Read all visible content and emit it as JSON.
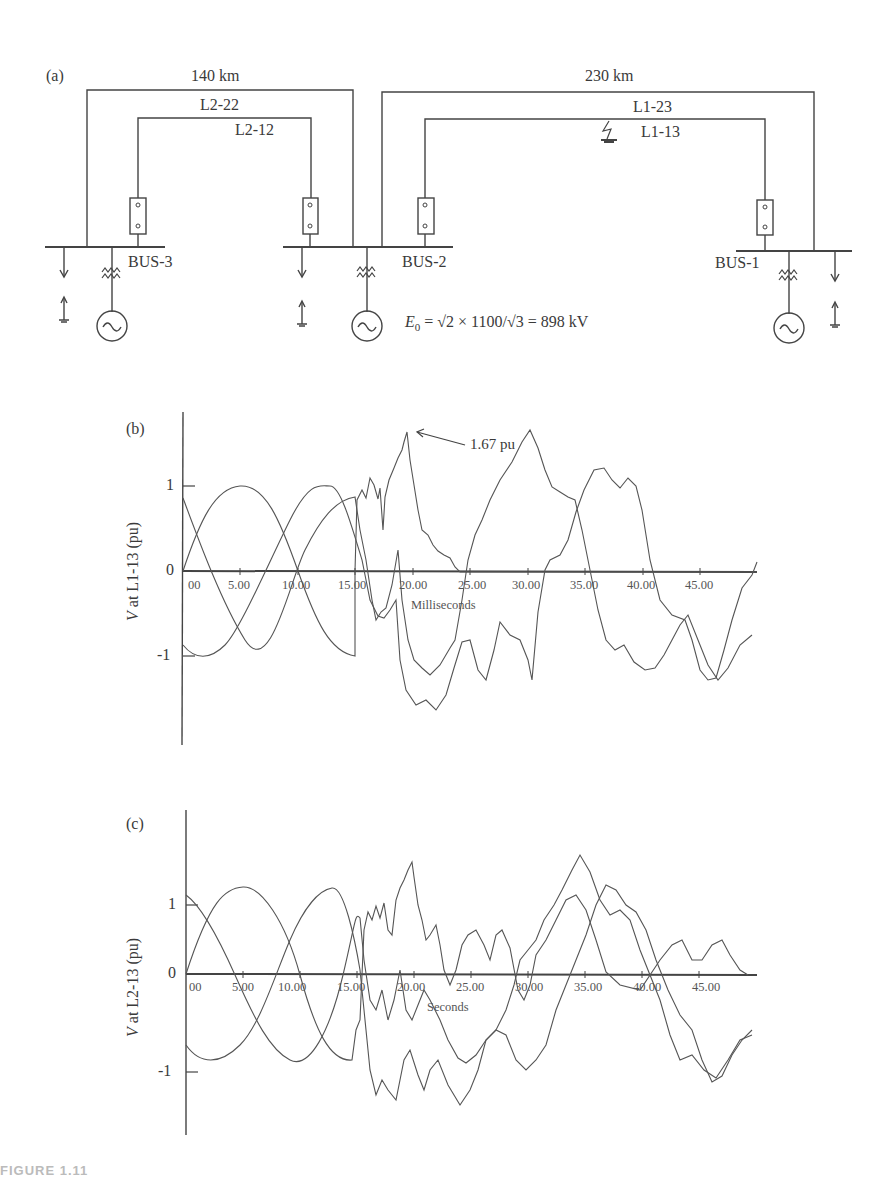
{
  "figure": {
    "caption_partial": "FIGURE 1.11",
    "panel_a": {
      "label": "(a)",
      "line_top_left": "140 km",
      "line_top_right": "230 km",
      "circuit_labels": [
        "L2-22",
        "L2-12",
        "L1-23",
        "L1-13"
      ],
      "buses": [
        "BUS-3",
        "BUS-2",
        "BUS-1"
      ],
      "equation": "E₀ = √2 × 1100/√3 = 898 kV",
      "equation_parts": {
        "lhs": "E",
        "sub": "0",
        "rhs": " = √2 × 1100/√3 = 898 kV"
      },
      "fault_location": "L1-13"
    },
    "panel_b": {
      "label": "(b)",
      "ylabel": "V at L1-13 (pu)",
      "xlabel": "Milliseconds",
      "yticks": [
        "1",
        "0",
        "-1"
      ],
      "xticks": [
        "00",
        "5.00",
        "10.00",
        "15.00",
        "20.00",
        "25.00",
        "30.00",
        "35.00",
        "40.00",
        "45.00"
      ],
      "annotation": "1.67 pu"
    },
    "panel_c": {
      "label": "(c)",
      "ylabel": "V at L2-13 (pu)",
      "xlabel": "Seconds",
      "yticks": [
        "1",
        "0",
        "-1"
      ],
      "xticks": [
        "00",
        "5.00",
        "10.00",
        "15.00",
        "20.00",
        "25.00",
        "30.00",
        "35.00",
        "40.00",
        "45.00"
      ]
    }
  },
  "chart_data": [
    {
      "type": "line",
      "title": "(b) Voltage at L1-13 during fault",
      "xlabel": "Milliseconds",
      "ylabel": "V at L1-13 (pu)",
      "xlim": [
        0,
        49
      ],
      "ylim": [
        -1.8,
        1.8
      ],
      "grid": false,
      "annotations": [
        {
          "text": "1.67 pu",
          "x": 19.5,
          "y": 1.67
        }
      ],
      "x": [
        0,
        2.5,
        5,
        7.5,
        10,
        12.5,
        15,
        17.5,
        19.5,
        22.5,
        25,
        27.5,
        30,
        32.5,
        35,
        37.5,
        40,
        42.5,
        45,
        47.5,
        49
      ],
      "series": [
        {
          "name": "Phase A",
          "values": [
            0.0,
            0.7,
            1.0,
            0.7,
            0.0,
            -0.7,
            -1.0,
            0.85,
            1.67,
            0.25,
            0.0,
            0.0,
            0.0,
            0.0,
            0.0,
            0.0,
            0.0,
            0.0,
            0.0,
            0.0,
            0.0
          ]
        },
        {
          "name": "Phase B",
          "values": [
            0.87,
            0.1,
            -0.5,
            -1.0,
            -0.5,
            0.5,
            1.0,
            -0.8,
            -0.9,
            -1.3,
            -0.6,
            0.5,
            0.95,
            1.4,
            0.6,
            0.3,
            -0.9,
            -1.2,
            -0.6,
            -1.3,
            -0.8
          ]
        },
        {
          "name": "Phase C",
          "values": [
            -0.87,
            -0.95,
            -0.5,
            0.3,
            1.0,
            0.5,
            -0.3,
            -0.6,
            -0.95,
            -1.1,
            -1.3,
            -0.9,
            -1.1,
            0.05,
            0.6,
            1.1,
            0.9,
            0.0,
            -0.6,
            0.2,
            0.75
          ]
        }
      ]
    },
    {
      "type": "line",
      "title": "(c) Voltage at L2-13",
      "xlabel": "Seconds",
      "ylabel": "V at L2-13 (pu)",
      "xlim": [
        0,
        49
      ],
      "ylim": [
        -1.9,
        1.9
      ],
      "grid": false,
      "x": [
        0,
        2.5,
        5,
        7.5,
        10,
        12.5,
        15,
        17.5,
        19.5,
        22.5,
        25,
        27.5,
        30,
        32.5,
        35,
        37.5,
        40,
        42.5,
        45,
        47.5,
        49
      ],
      "series": [
        {
          "name": "Phase A",
          "values": [
            0.0,
            0.9,
            1.25,
            0.9,
            0.0,
            -0.9,
            -1.25,
            1.0,
            1.85,
            0.5,
            0.6,
            0.5,
            0.1,
            0.2,
            0.3,
            0.0,
            0.0,
            0.4,
            0.45,
            0.3,
            0.0
          ]
        },
        {
          "name": "Phase B",
          "values": [
            1.1,
            0.3,
            -0.6,
            -0.9,
            -0.2,
            0.6,
            1.2,
            -0.5,
            -0.3,
            -1.2,
            -0.4,
            0.2,
            0.9,
            1.5,
            0.8,
            0.4,
            -0.9,
            -1.1,
            -0.5,
            -1.3,
            -0.8
          ]
        },
        {
          "name": "Phase C",
          "values": [
            -0.9,
            -0.85,
            0.0,
            0.9,
            1.25,
            0.0,
            -0.8,
            -0.2,
            -0.3,
            -0.6,
            -1.0,
            -0.9,
            -1.2,
            -0.05,
            0.5,
            1.2,
            1.1,
            0.0,
            -0.6,
            0.3,
            0.95
          ]
        }
      ]
    }
  ]
}
